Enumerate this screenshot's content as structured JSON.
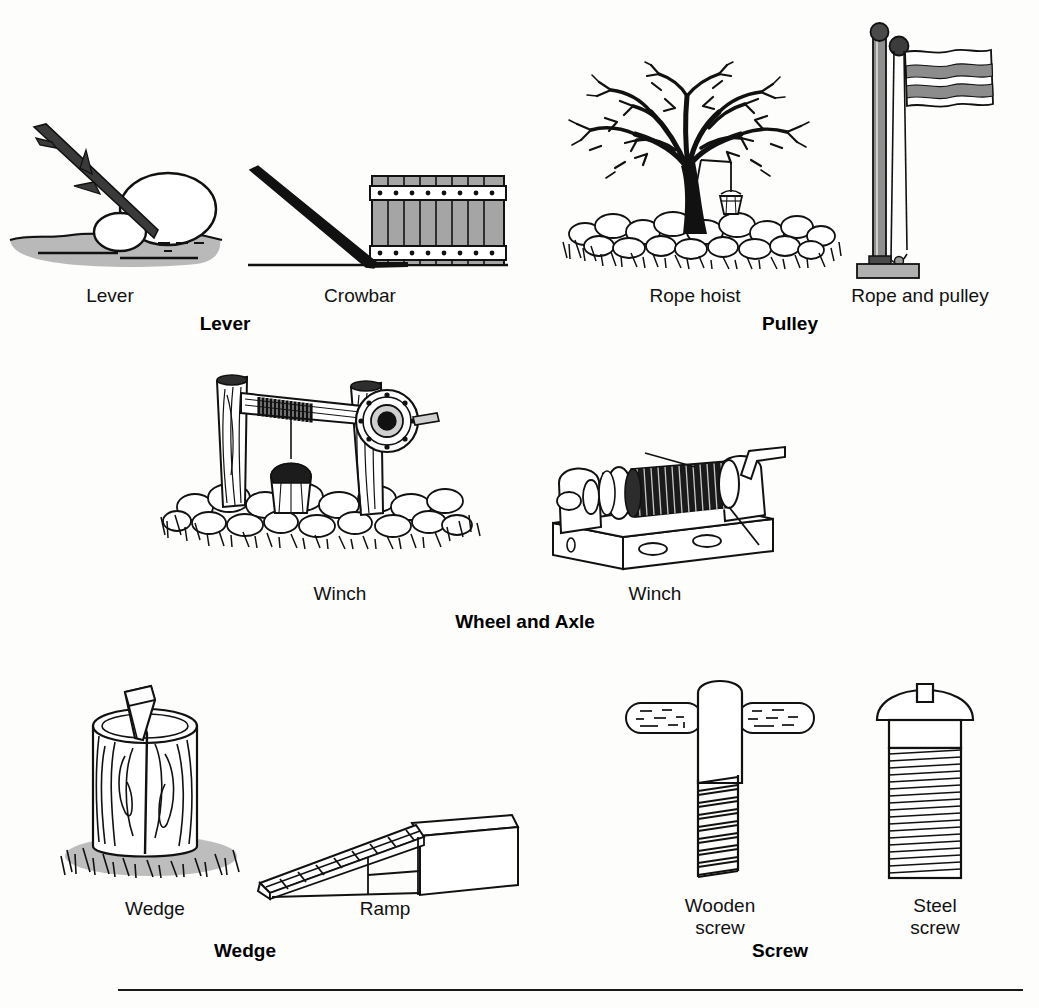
{
  "figure": {
    "type": "illustrated-diagram",
    "background_color": "#fdfdfc",
    "ink_color": "#000000",
    "has_bottom_rule": true
  },
  "sections": [
    {
      "id": "lever",
      "category_label": "Lever",
      "items": [
        {
          "id": "lever-stick",
          "label": "Lever",
          "depicts": "branch used as lever with rock fulcrum prying a boulder"
        },
        {
          "id": "crowbar",
          "label": "Crowbar",
          "depicts": "crowbar prying a banded wooden crate"
        }
      ]
    },
    {
      "id": "pulley",
      "category_label": "Pulley",
      "items": [
        {
          "id": "rope-hoist",
          "label": "Rope hoist",
          "depicts": "bucket hoisted by rope over a tree branch above stones and grass"
        },
        {
          "id": "rope-and-pulley",
          "label": "Rope and pulley",
          "depicts": "flagpole with pulley, halyard and flag on a base plate"
        }
      ]
    },
    {
      "id": "wheel-and-axle",
      "category_label": "Wheel and Axle",
      "items": [
        {
          "id": "well-winch",
          "label": "Winch",
          "depicts": "well winch with rope drum, crank wheel and bucket over stone well"
        },
        {
          "id": "hand-winch",
          "label": "Winch",
          "depicts": "hand-crank cable winch on a mounting frame"
        }
      ]
    },
    {
      "id": "wedge",
      "category_label": "Wedge",
      "items": [
        {
          "id": "splitting-wedge",
          "label": "Wedge",
          "depicts": "metal wedge driven into a log stump in grass"
        },
        {
          "id": "ramp",
          "label": "Ramp",
          "depicts": "inclined plank ramp with cross slats up to a platform"
        }
      ]
    },
    {
      "id": "screw",
      "category_label": "Screw",
      "items": [
        {
          "id": "wooden-screw",
          "label": "Wooden\nscrew",
          "depicts": "large wooden screw with T-shaped handle and coarse threads"
        },
        {
          "id": "steel-screw",
          "label": "Steel\nscrew",
          "depicts": "slotted round-head steel machine screw with fine threads"
        }
      ]
    }
  ],
  "colors": {
    "ink": "#000000",
    "ground_gray": "#a8a8a8",
    "crate_gray": "#9a9a9a",
    "pole_gray": "#8f8f8f",
    "flag_gray": "#8c8c8c",
    "base_gray": "#b0b0b0",
    "paper": "#fdfdfc"
  }
}
